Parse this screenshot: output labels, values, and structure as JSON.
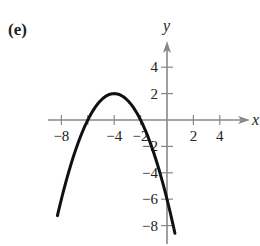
{
  "panel": {
    "label": "(e)"
  },
  "chart_data": {
    "type": "line",
    "title": "",
    "xlabel": "x",
    "ylabel": "y",
    "xlim": [
      -9,
      6
    ],
    "ylim": [
      -9,
      6
    ],
    "grid": false,
    "x_ticks": [
      -8,
      -6,
      -4,
      -2,
      2,
      4
    ],
    "x_tick_labels": [
      "−8",
      "",
      "−4",
      "−2",
      "2",
      "4"
    ],
    "y_ticks": [
      4,
      2,
      -2,
      -4,
      -6,
      -8
    ],
    "y_tick_labels": [
      "4",
      "2",
      "−2",
      "−4",
      "−6",
      "−8"
    ],
    "series": [
      {
        "name": "parabola",
        "equation": "y = -(1/2)(x+4)^2 + 2",
        "vertex": [
          -4,
          2
        ],
        "x_intercepts": [
          -6,
          -2
        ],
        "y_intercept": -6,
        "x": [
          -8.3,
          -8,
          -7,
          -6,
          -5,
          -4,
          -3,
          -2,
          -1,
          0,
          0.6
        ],
        "values": [
          -7.2,
          -6,
          -2.5,
          0,
          1.5,
          2,
          1.5,
          0,
          -2.5,
          -6,
          -8.6
        ]
      }
    ],
    "line_color": "#111111",
    "axis_color": "#888888"
  }
}
